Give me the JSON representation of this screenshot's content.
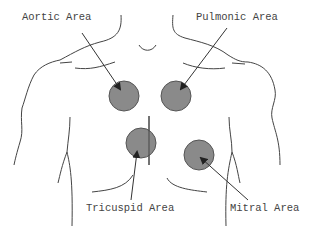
{
  "colors": {
    "marker_fill": "#8a8a8a",
    "marker_stroke": "#555555",
    "line": "#444444",
    "text": "#444444",
    "background": "#ffffff"
  },
  "labels": {
    "aortic": "Aortic Area",
    "pulmonic": "Pulmonic Area",
    "tricuspid": "Tricuspid Area",
    "mitral": "Mitral Area"
  },
  "markers": [
    {
      "name": "aortic",
      "cx": 124,
      "cy": 96,
      "r": 15
    },
    {
      "name": "pulmonic",
      "cx": 176,
      "cy": 96,
      "r": 15
    },
    {
      "name": "tricuspid",
      "cx": 141,
      "cy": 143,
      "r": 15
    },
    {
      "name": "mitral",
      "cx": 199,
      "cy": 155,
      "r": 15
    }
  ]
}
